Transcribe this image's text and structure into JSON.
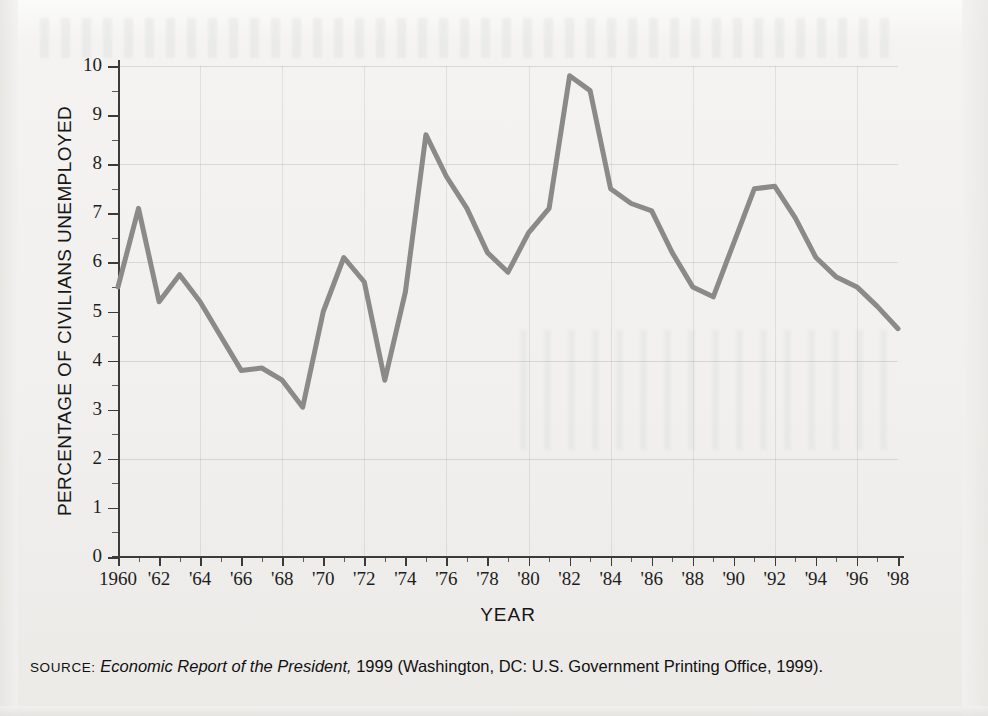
{
  "chart_data": {
    "type": "line",
    "title": "",
    "xlabel": "YEAR",
    "ylabel": "PERCENTAGE OF CIVILIANS UNEMPLOYED",
    "xlim": [
      1960,
      1998
    ],
    "ylim": [
      0,
      10
    ],
    "grid": true,
    "legend": "none",
    "y_ticks": [
      "0",
      "1",
      "2",
      "3",
      "4",
      "5",
      "6",
      "7",
      "8",
      "9",
      "10"
    ],
    "y_tick_values": [
      0,
      1,
      2,
      3,
      4,
      5,
      6,
      7,
      8,
      9,
      10
    ],
    "x_ticks": [
      "1960",
      "'62",
      "'64",
      "'66",
      "'68",
      "'70",
      "'72",
      "'74",
      "'76",
      "'78",
      "'80",
      "'82",
      "'84",
      "'86",
      "'88",
      "'90",
      "'92",
      "'94",
      "'96",
      "'98"
    ],
    "x_tick_values": [
      1960,
      1962,
      1964,
      1966,
      1968,
      1970,
      1972,
      1974,
      1976,
      1978,
      1980,
      1982,
      1984,
      1986,
      1988,
      1990,
      1992,
      1994,
      1996,
      1998
    ],
    "x": [
      1960,
      1961,
      1962,
      1963,
      1964,
      1965,
      1966,
      1967,
      1968,
      1969,
      1970,
      1971,
      1972,
      1973,
      1974,
      1975,
      1976,
      1977,
      1978,
      1979,
      1980,
      1981,
      1982,
      1983,
      1984,
      1985,
      1986,
      1987,
      1988,
      1989,
      1990,
      1991,
      1992,
      1993,
      1994,
      1995,
      1996,
      1997,
      1998
    ],
    "values": [
      5.5,
      7.1,
      5.2,
      5.75,
      5.2,
      4.5,
      3.8,
      3.85,
      3.6,
      3.05,
      5.0,
      6.1,
      5.6,
      3.6,
      5.4,
      8.6,
      7.75,
      7.1,
      6.2,
      5.8,
      6.6,
      7.1,
      9.8,
      9.5,
      7.5,
      7.2,
      7.05,
      6.2,
      5.5,
      5.3,
      6.4,
      7.5,
      7.55,
      6.9,
      6.1,
      5.7,
      5.5,
      5.1,
      4.65
    ],
    "series_name": "Percentage of civilians unemployed",
    "line_color": "#8a8a8a",
    "line_width": 5
  },
  "axes": {
    "y_title": "PERCENTAGE OF CIVILIANS UNEMPLOYED",
    "x_title": "YEAR"
  },
  "source": {
    "label": "SOURCE:",
    "italic_title": "Economic Report of the President,",
    "rest": " 1999 (Washington, DC: U.S. Government Printing Office, 1999)."
  }
}
